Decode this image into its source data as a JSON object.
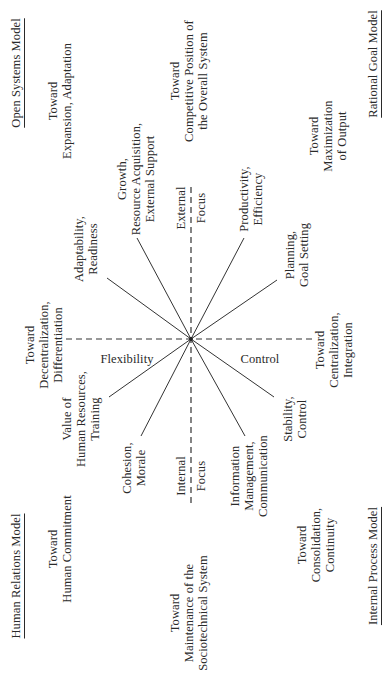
{
  "diagram": {
    "center": {
      "x": 342,
      "y": 191
    },
    "line_color": "#333333",
    "axes": {
      "horizontal": {
        "left_label": {
          "line1": "Internal",
          "line2": "Focus"
        },
        "right_label": {
          "line1": "External",
          "line2": "Focus"
        }
      },
      "vertical": {
        "top_label": "Flexibility",
        "bottom_label": "Control"
      }
    },
    "models": {
      "top_left": "Human Relations Model",
      "top_right": "Open Systems Model",
      "bottom_left": "Internal Process Model",
      "bottom_right": "Rational Goal Model"
    },
    "spoke_labels": {
      "hr_inner": {
        "lines": [
          "Cohesion,",
          "Morale"
        ]
      },
      "hr_outer": {
        "lines": [
          "Value of",
          "Human Resources,",
          "Training"
        ]
      },
      "os_outer": {
        "lines": [
          "Adaptability,",
          "Readiness"
        ]
      },
      "os_inner": {
        "lines": [
          "Growth,",
          "Resource Acquisition,",
          "External Support"
        ]
      },
      "rg_inner": {
        "lines": [
          "Productivity,",
          "Efficiency"
        ]
      },
      "rg_outer": {
        "lines": [
          "Planning,",
          "Goal Setting"
        ]
      },
      "ip_outer": {
        "lines": [
          "Stability,",
          "Control"
        ]
      },
      "ip_inner": {
        "lines": [
          "Information",
          "Management,",
          "Communication"
        ]
      }
    },
    "outcome_labels": {
      "human_commitment": {
        "lines": [
          "Toward",
          "Human Commitment"
        ]
      },
      "sociotechnical": {
        "lines": [
          "Toward",
          "Maintenance of the",
          "Sociotechnical System"
        ]
      },
      "decentralization": {
        "lines": [
          "Toward",
          "Decentralization,",
          "Differentiation"
        ]
      },
      "expansion": {
        "lines": [
          "Toward",
          "Expansion, Adaptation"
        ]
      },
      "competitive": {
        "lines": [
          "Toward",
          "Competitive Position of",
          "the Overall System"
        ]
      },
      "maximization": {
        "lines": [
          "Toward",
          "Maximization",
          "of Output"
        ]
      },
      "centralization": {
        "lines": [
          "Toward",
          "Centralization,",
          "Integration"
        ]
      },
      "consolidation": {
        "lines": [
          "Toward",
          "Consolidation,",
          "Continuity"
        ]
      }
    }
  }
}
